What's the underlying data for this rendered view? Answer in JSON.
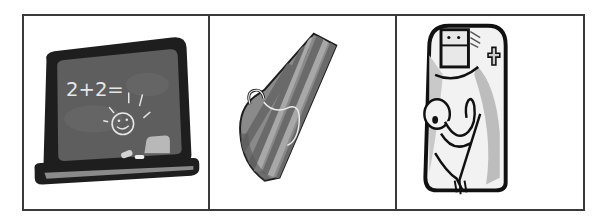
{
  "panels": [
    {
      "name": "chalkboard",
      "chalk_text": "2+2="
    },
    {
      "name": "striped-sled"
    },
    {
      "name": "nurse-holding-baby"
    }
  ],
  "colors": {
    "border": "#3a3a3a",
    "board_frame": "#1e1e1e",
    "board_surface": "#5e5e5e",
    "chalk": "#e6e6e6",
    "stripe_dark": "#6a6a6a",
    "stripe_light": "#9a9a9a"
  }
}
